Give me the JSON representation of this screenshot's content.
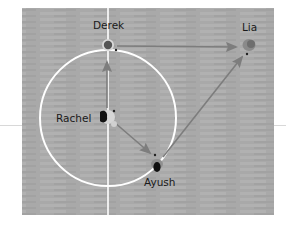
{
  "diagram": {
    "type": "soccer passing diagram",
    "colors": {
      "field": "#a9a9a9",
      "field_stripe": "#b3b3b3",
      "lines": "#ffffff",
      "arrow": "#7a7a7a",
      "label": "#1a1a1a"
    },
    "players": [
      {
        "name": "Derek",
        "x": 108,
        "y": 46
      },
      {
        "name": "Lia",
        "x": 248,
        "y": 46
      },
      {
        "name": "Rachel",
        "x": 106,
        "y": 116
      },
      {
        "name": "Ayush",
        "x": 155,
        "y": 162
      }
    ],
    "passes": [
      {
        "from": "Rachel",
        "to": "Derek"
      },
      {
        "from": "Rachel",
        "to": "Ayush"
      },
      {
        "from": "Derek",
        "to": "Lia"
      },
      {
        "from": "Ayush",
        "to": "Lia"
      }
    ]
  },
  "labels": {
    "derek": "Derek",
    "lia": "Lia",
    "rachel": "Rachel",
    "ayush": "Ayush"
  }
}
